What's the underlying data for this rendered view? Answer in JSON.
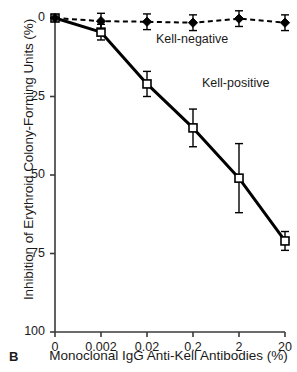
{
  "panel": {
    "label": "B"
  },
  "chart_data": {
    "type": "line",
    "title": "",
    "xlabel": "Monoclonal IgG Anti-Kell Antibodies (%)",
    "ylabel": "Inhibition of Erythroid Colony-Forming Units (%)",
    "categories": [
      "0",
      "0.002",
      "0.02",
      "0.2",
      "2",
      "20"
    ],
    "xtick_labels": [
      "0",
      "0.002",
      "0.02",
      "0.2",
      "2",
      "20"
    ],
    "ytick_labels": [
      "0",
      "25",
      "50",
      "75",
      "100"
    ],
    "ytick_values": [
      0,
      25,
      50,
      75,
      100
    ],
    "ylim": [
      0,
      100
    ],
    "y_inverted": true,
    "grid": false,
    "legend_position": "inline-annotation",
    "series": [
      {
        "name": "Kell-positive",
        "marker": "open-square",
        "line_style": "solid",
        "line_width": 3,
        "color": "#000000",
        "values": [
          0,
          4.5,
          21,
          35,
          51,
          71
        ],
        "errors_low": [
          0,
          2.5,
          4,
          6,
          11,
          3
        ],
        "errors_high": [
          0,
          2.5,
          4,
          6,
          11,
          3
        ]
      },
      {
        "name": "Kell-negative",
        "marker": "filled-diamond",
        "line_style": "dashed",
        "line_width": 2,
        "color": "#000000",
        "values": [
          0,
          1.0,
          1.2,
          1.5,
          0.2,
          1.5
        ],
        "errors_low": [
          0,
          2.5,
          2.5,
          2.5,
          2.5,
          2.5
        ],
        "errors_high": [
          0,
          2.5,
          2.5,
          2.5,
          2.5,
          2.5
        ]
      }
    ],
    "annotations": [
      {
        "text": "Kell-negative",
        "x": 0.02,
        "y": 7
      },
      {
        "text": "Kell-positive",
        "x": 0.2,
        "y": 21
      }
    ]
  }
}
